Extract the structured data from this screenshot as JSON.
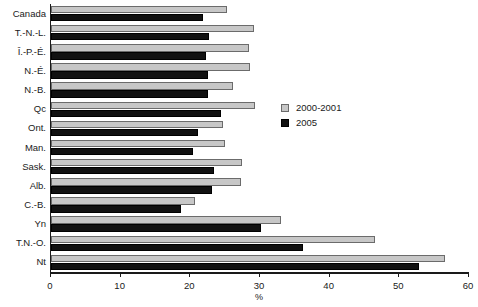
{
  "chart_data": {
    "type": "bar",
    "orientation": "horizontal",
    "title": "",
    "xlabel": "%",
    "ylabel": "",
    "xlim": [
      0,
      60
    ],
    "xticks": [
      0,
      10,
      20,
      30,
      40,
      50,
      60
    ],
    "xtick_labels": [
      "0",
      "10",
      "20",
      "30",
      "40",
      "50",
      "60"
    ],
    "grid": false,
    "legend_position": "inside-right",
    "categories": [
      "Canada",
      "T.-N.-L.",
      "Î.-P.-É.",
      "N.-É.",
      "N.-B.",
      "Qc",
      "Ont.",
      "Man.",
      "Sask.",
      "Alb.",
      "C.-B.",
      "Yn",
      "T.N.-O.",
      "Nt"
    ],
    "series": [
      {
        "name": "2000-2001",
        "color": "#c7c7c7",
        "values": [
          25.3,
          29.1,
          28.4,
          28.6,
          26.1,
          29.3,
          24.7,
          25.0,
          27.4,
          27.3,
          20.7,
          33.0,
          46.5,
          56.5
        ]
      },
      {
        "name": "2005",
        "color": "#111111",
        "values": [
          21.8,
          22.7,
          22.2,
          22.5,
          22.5,
          24.4,
          21.1,
          20.4,
          23.4,
          23.1,
          18.6,
          30.1,
          36.2,
          52.8
        ]
      }
    ]
  },
  "legend": {
    "entries": [
      {
        "label": "2000-2001",
        "swatch": "light"
      },
      {
        "label": "2005",
        "swatch": "dark"
      }
    ]
  }
}
